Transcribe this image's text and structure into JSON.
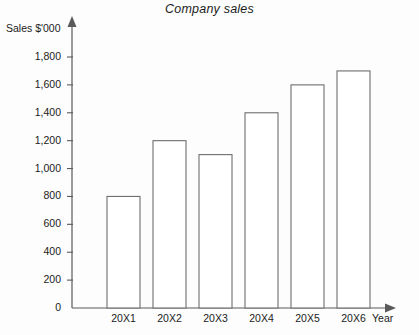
{
  "chart_data": {
    "type": "bar",
    "title": "Company sales",
    "xlabel": "Year",
    "ylabel": "Sales $'000",
    "categories": [
      "20X1",
      "20X2",
      "20X3",
      "20X4",
      "20X5",
      "20X6"
    ],
    "values": [
      800,
      1200,
      1100,
      1400,
      1600,
      1700
    ],
    "series": [
      {
        "name": "Sales",
        "values": [
          800,
          1200,
          1100,
          1400,
          1600,
          1700
        ]
      }
    ],
    "ylim": [
      0,
      1800
    ],
    "ytick_values": [
      0,
      200,
      400,
      600,
      800,
      1000,
      1200,
      1400,
      1600,
      1800
    ],
    "ytick_labels": [
      "0",
      "200",
      "400",
      "600",
      "800",
      "1,000",
      "1,200",
      "1,400",
      "1,600",
      "1,800"
    ],
    "grid": false,
    "legend": null,
    "legend_position": "none",
    "bar_fill_color": "#ffffff",
    "bar_border_color": "#6e6e6e",
    "axis_color": "#5a5a5a",
    "text_color": "#1b1b1b",
    "background_color": "#fdfdfd",
    "axis_arrows": true
  }
}
